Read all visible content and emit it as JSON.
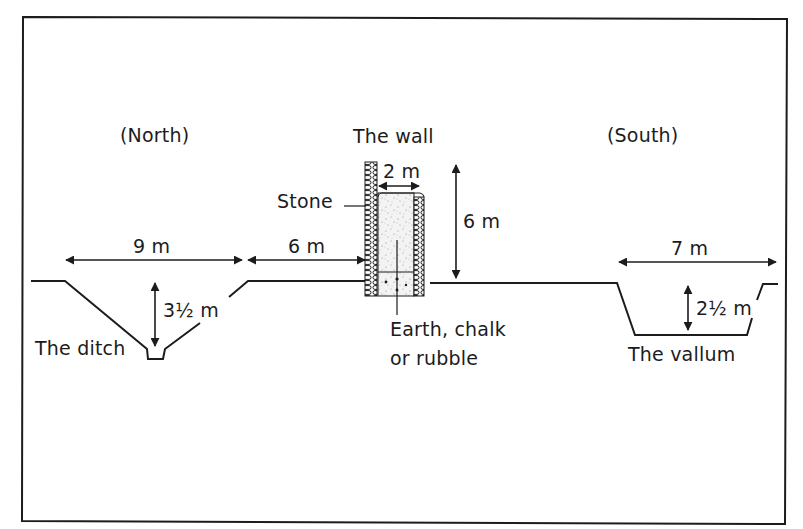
{
  "diagram": {
    "orientation": {
      "north_label": "(North)",
      "south_label": "(South)"
    },
    "features": {
      "wall": {
        "label": "The wall",
        "stone_label": "Stone",
        "core_label_line1": "Earth, chalk",
        "core_label_line2": "or rubble",
        "width_label": "2 m",
        "height_label": "6 m"
      },
      "ditch": {
        "label": "The ditch",
        "width_label": "9 m",
        "depth_label": "3½ m"
      },
      "berm": {
        "width_label": "6 m"
      },
      "vallum": {
        "label": "The vallum",
        "width_label": "7 m",
        "depth_label": "2½ m"
      }
    },
    "colors": {
      "line": "#1c1c1c",
      "fill": "#ffffff",
      "core_speckle": "#9a9a9a"
    }
  }
}
